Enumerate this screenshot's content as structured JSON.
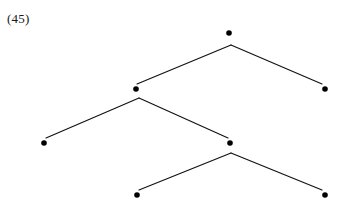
{
  "figure": {
    "label": "(45)",
    "width": 344,
    "height": 207,
    "background_color": "#ffffff",
    "line_color": "#111111",
    "node_color": "#000000",
    "label_color": "#1a1a1a"
  },
  "chart_data": {
    "type": "diagram",
    "diagram_kind": "binary-tree",
    "title": "(45)",
    "xlabel": "",
    "ylabel": "",
    "grid": false,
    "legend": null,
    "nodes": [
      {
        "id": "root",
        "label": "",
        "x": 229,
        "y": 33,
        "level": 0,
        "kind": "internal"
      },
      {
        "id": "n-l",
        "label": "",
        "x": 136,
        "y": 89,
        "level": 1,
        "kind": "internal"
      },
      {
        "id": "n-r",
        "label": "",
        "x": 325,
        "y": 89,
        "level": 1,
        "kind": "leaf"
      },
      {
        "id": "n-ll",
        "label": "",
        "x": 44,
        "y": 143,
        "level": 2,
        "kind": "leaf"
      },
      {
        "id": "n-lr",
        "label": "",
        "x": 230,
        "y": 143,
        "level": 2,
        "kind": "internal"
      },
      {
        "id": "n-lrl",
        "label": "",
        "x": 137,
        "y": 195,
        "level": 3,
        "kind": "leaf"
      },
      {
        "id": "n-lrr",
        "label": "",
        "x": 325,
        "y": 195,
        "level": 3,
        "kind": "leaf"
      }
    ],
    "apexes": [
      {
        "id": "apex-root",
        "parent": "root",
        "x": 231,
        "y": 45
      },
      {
        "id": "apex-n-l",
        "parent": "n-l",
        "x": 139,
        "y": 98
      },
      {
        "id": "apex-n-lr",
        "parent": "n-lr",
        "x": 231,
        "y": 153
      }
    ],
    "edges": [
      {
        "id": "e-root-left",
        "from": "apex-root",
        "to": "n-l",
        "x1": 231,
        "y1": 45,
        "x2": 137,
        "y2": 84
      },
      {
        "id": "e-root-right",
        "from": "apex-root",
        "to": "n-r",
        "x1": 231,
        "y1": 45,
        "x2": 322,
        "y2": 84
      },
      {
        "id": "e-nl-left",
        "from": "apex-n-l",
        "to": "n-ll",
        "x1": 139,
        "y1": 98,
        "x2": 46,
        "y2": 138
      },
      {
        "id": "e-nl-right",
        "from": "apex-n-l",
        "to": "n-lr",
        "x1": 139,
        "y1": 98,
        "x2": 228,
        "y2": 138
      },
      {
        "id": "e-nlr-left",
        "from": "apex-n-lr",
        "to": "n-lrl",
        "x1": 231,
        "y1": 153,
        "x2": 139,
        "y2": 190
      },
      {
        "id": "e-nlr-right",
        "from": "apex-n-lr",
        "to": "n-lrr",
        "x1": 231,
        "y1": 153,
        "x2": 322,
        "y2": 190
      }
    ],
    "node_radius": 2.8,
    "node_count": 7,
    "edge_count": 6,
    "depth": 4
  }
}
